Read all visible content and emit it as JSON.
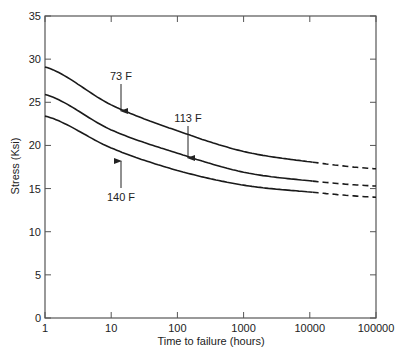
{
  "chart_data": {
    "type": "line",
    "title": "",
    "xlabel": "Time to failure (hours)",
    "ylabel": "Stress (Ksi)",
    "xscale": "log",
    "xlim": [
      1,
      100000
    ],
    "ylim": [
      0,
      35
    ],
    "grid": false,
    "legend": "none (inline annotations with arrows)",
    "x_ticks": [
      1,
      10,
      100,
      1000,
      10000,
      100000
    ],
    "x_tick_labels": [
      "1",
      "10",
      "100",
      "1000",
      "10000",
      "100000"
    ],
    "y_ticks": [
      0,
      5,
      10,
      15,
      20,
      25,
      30,
      35
    ],
    "y_tick_labels": [
      "0",
      "5",
      "10",
      "15",
      "20",
      "25",
      "30",
      "35"
    ],
    "x": [
      1,
      10,
      100,
      1000,
      10000,
      100000
    ],
    "series": [
      {
        "name": "73 F",
        "values": [
          29.1,
          24.7,
          21.7,
          19.3,
          18.1,
          17.3
        ],
        "solid_until": 12000,
        "dashed_after": 12000
      },
      {
        "name": "113 F",
        "values": [
          25.9,
          21.8,
          19.1,
          16.9,
          15.9,
          15.3
        ],
        "solid_until": 12000,
        "dashed_after": 12000
      },
      {
        "name": "140 F",
        "values": [
          23.4,
          19.7,
          17.1,
          15.4,
          14.6,
          14.0
        ],
        "solid_until": 12000,
        "dashed_after": 12000
      }
    ],
    "annotations": [
      {
        "text": "73 F",
        "target_series": "73 F",
        "x": 15,
        "direction": "down"
      },
      {
        "text": "113 F",
        "target_series": "113 F",
        "x": 150,
        "direction": "down"
      },
      {
        "text": "140 F",
        "target_series": "140 F",
        "x": 15,
        "direction": "up"
      }
    ]
  },
  "labels": {
    "xlabel": "Time to failure (hours)",
    "ylabel": "Stress (Ksi)",
    "ann_73": "73 F",
    "ann_113": "113 F",
    "ann_140": "140 F"
  },
  "colors": {
    "line": "#1a1a1a",
    "axis": "#555555"
  }
}
